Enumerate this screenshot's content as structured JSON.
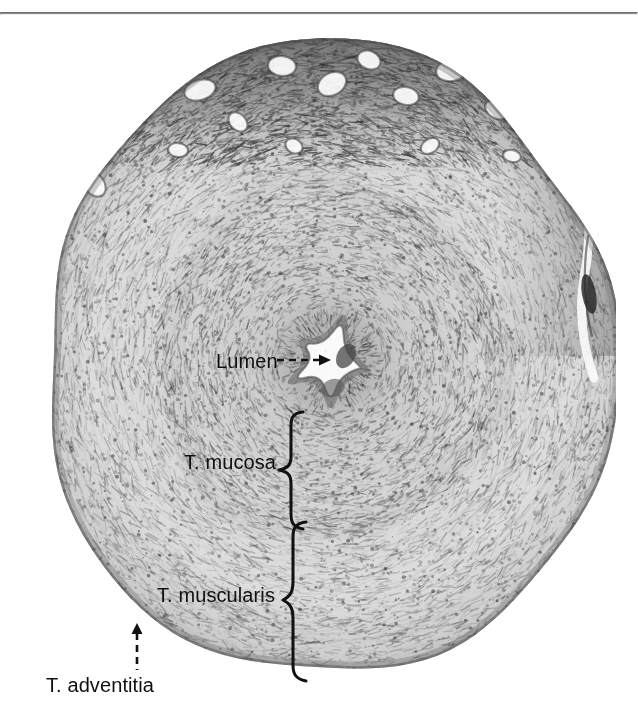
{
  "figure": {
    "kind": "light-micrograph",
    "stain_tone": "grayscale"
  },
  "top_rule": {
    "color": "#8a8a8a"
  },
  "labels": [
    {
      "id": "lumen",
      "text": "Lumen",
      "leader": "dashed-arrow",
      "leader_direction": "right",
      "target": "central star-shaped lumen"
    },
    {
      "id": "mucosa",
      "text": "T. mucosa",
      "leader": "curly-brace",
      "leader_direction": "right",
      "target": "inner mucosal layer"
    },
    {
      "id": "muscularis",
      "text": "T. muscularis",
      "leader": "curly-brace",
      "leader_direction": "right",
      "target": "smooth muscle layer"
    },
    {
      "id": "adventitia",
      "text": "T. adventitia",
      "leader": "dashed-arrow",
      "leader_direction": "up",
      "target": "outer connective tissue coat"
    }
  ],
  "colors": {
    "ink": "#101010",
    "rule": "#8a8a8a",
    "background": "#ffffff"
  }
}
